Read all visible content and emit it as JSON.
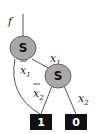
{
  "diagram": {
    "root_label": "f",
    "nodes": [
      {
        "id": "s1",
        "label": "S"
      },
      {
        "id": "s2",
        "label": "S"
      }
    ],
    "edges": {
      "s1_high": {
        "var": "x",
        "sub": "1",
        "negated": false
      },
      "s1_low": {
        "var": "x",
        "sub": "1",
        "negated": true
      },
      "s2_low": {
        "var": "x",
        "sub": "2",
        "negated": true
      },
      "s2_high": {
        "var": "x",
        "sub": "2",
        "negated": false
      }
    },
    "terminals": [
      {
        "id": "t1",
        "label": "1"
      },
      {
        "id": "t0",
        "label": "0"
      }
    ],
    "colors": {
      "node_fill": "#a8a8a8",
      "terminal_fill": "#111111",
      "line": "#555555"
    }
  }
}
